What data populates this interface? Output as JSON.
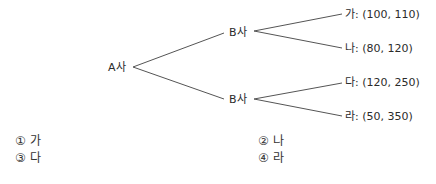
{
  "tree": {
    "root": "A사",
    "branches": [
      {
        "node": "B사",
        "leaves": [
          {
            "label": "가: (100, 110)"
          },
          {
            "label": "나: (80, 120)"
          }
        ]
      },
      {
        "node": "B사",
        "leaves": [
          {
            "label": "다: (120, 250)"
          },
          {
            "label": "라: (50, 350)"
          }
        ]
      }
    ]
  },
  "options": [
    {
      "label": "① 가"
    },
    {
      "label": "② 나"
    },
    {
      "label": "③ 다"
    },
    {
      "label": "④ 라"
    }
  ],
  "colors": {
    "line": "#555555",
    "text": "#2b2b2b"
  }
}
